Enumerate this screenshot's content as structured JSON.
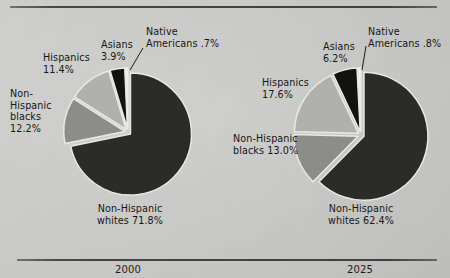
{
  "figure": {
    "background_color": "#c9c9c7",
    "rule_color": "#333331"
  },
  "panels": [
    {
      "id": "2000",
      "year_label": "2000",
      "labels": {
        "hispanics": "Hispanics\n11.4%",
        "asians": "Asians\n3.9%",
        "native": "Native\nAmericans  .7%",
        "blacks": "Non-\nHispanic\nblacks\n12.2%",
        "whites": "Non-Hispanic\nwhites  71.8%"
      }
    },
    {
      "id": "2025",
      "year_label": "2025",
      "labels": {
        "hispanics": "Hispanics\n17.6%",
        "asians": "Asians\n6.2%",
        "native": "Native\nAmericans  .8%",
        "blacks": "Non-Hispanic\nblacks  13.0%",
        "whites": "Non-Hispanic\nwhites  62.4%"
      }
    }
  ],
  "chart_data": [
    {
      "type": "pie",
      "title": "2000",
      "labels": [
        "Non-Hispanic whites",
        "Non-Hispanic blacks",
        "Hispanics",
        "Asians",
        "Native Americans"
      ],
      "values": [
        71.8,
        12.2,
        11.4,
        3.9,
        0.7
      ],
      "value_suffix": "%",
      "colors": [
        "#2b2b29",
        "#8c8c8a",
        "#b0b0ae",
        "#121210",
        "#f2f2f0"
      ],
      "start_angle_deg": 0,
      "direction": "clockwise",
      "exploded": true,
      "legend": "callout-labels"
    },
    {
      "type": "pie",
      "title": "2025",
      "labels": [
        "Non-Hispanic whites",
        "Non-Hispanic blacks",
        "Hispanics",
        "Asians",
        "Native Americans"
      ],
      "values": [
        62.4,
        13.0,
        17.6,
        6.2,
        0.8
      ],
      "value_suffix": "%",
      "colors": [
        "#2b2b29",
        "#8c8c8a",
        "#b0b0ae",
        "#121210",
        "#f2f2f0"
      ],
      "start_angle_deg": 0,
      "direction": "clockwise",
      "exploded": true,
      "legend": "callout-labels"
    }
  ]
}
